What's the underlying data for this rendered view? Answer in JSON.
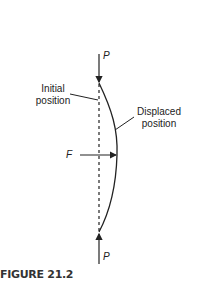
{
  "diagram": {
    "labels": {
      "load_top": "P",
      "load_bottom": "P",
      "force": "F",
      "initial_line1": "Initial",
      "initial_line2": "position",
      "displaced_line1": "Displaced",
      "displaced_line2": "position"
    },
    "caption": "FIGURE 21.2",
    "colors": {
      "stroke": "#222222"
    }
  }
}
